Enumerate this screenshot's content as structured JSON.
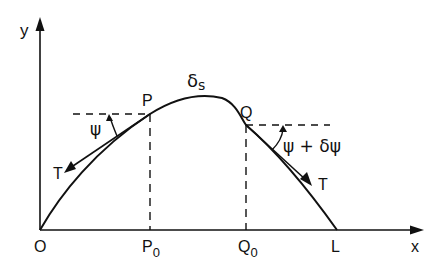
{
  "diagram": {
    "type": "catenary-element-diagram",
    "colors": {
      "ink": "#111111",
      "background": "#ffffff"
    },
    "axes": {
      "x_label": "x",
      "y_label": "y",
      "origin_label": "O"
    },
    "points": {
      "P": "P",
      "Q": "Q",
      "P0_base": "P",
      "P0_sub": "0",
      "Q0_base": "Q",
      "Q0_sub": "0",
      "L": "L"
    },
    "labels": {
      "arc_element": "δs",
      "arc_element_delta": "δ",
      "arc_element_s": "s",
      "angle_at_P": "ψ",
      "angle_at_Q": "ψ + δψ",
      "tension_left": "T",
      "tension_right": "T"
    }
  }
}
